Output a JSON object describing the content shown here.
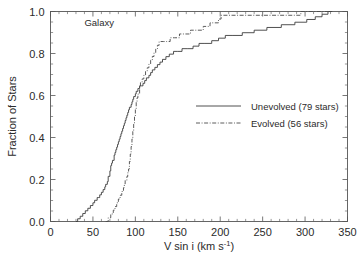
{
  "figure": {
    "panel_label": "Galaxy",
    "background": "#ffffff",
    "foreground": "#2b2b2b"
  },
  "chart_data": {
    "type": "line",
    "title": "",
    "subtitle": "",
    "xlabel": "V sin i (km s-1)",
    "xlabel_main": "V sin i (km s",
    "xlabel_sup": "-1",
    "xlabel_tail": ")",
    "ylabel": "Fraction of Stars",
    "xlim": [
      0,
      350
    ],
    "ylim": [
      0.0,
      1.0
    ],
    "xticks": [
      0,
      50,
      100,
      150,
      200,
      250,
      300,
      350
    ],
    "xticklabels": [
      "0",
      "50",
      "100",
      "150",
      "200",
      "250",
      "300",
      "350"
    ],
    "yticks": [
      0.0,
      0.2,
      0.4,
      0.6,
      0.8,
      1.0
    ],
    "yticklabels": [
      "0.0",
      "0.2",
      "0.4",
      "0.6",
      "0.8",
      "1.0"
    ],
    "x_minor_interval": 10,
    "y_minor_interval": 0.05,
    "grid": false,
    "ticks_all_sides": true,
    "tick_direction": "in",
    "annotations": [
      {
        "text": "Galaxy",
        "x": 40,
        "y": 0.93
      }
    ],
    "legend": {
      "position": "center-right",
      "frame": false,
      "entries": [
        {
          "label": "Unevolved (79 stars)",
          "linestyle": "solid",
          "color": "#3c3c3c"
        },
        {
          "label": "Evolved (56 stars)",
          "linestyle": "dashdot",
          "color": "#4a4a4a"
        }
      ]
    },
    "series": [
      {
        "name": "Unevolved (79 stars)",
        "n_stars": 79,
        "linestyle": "solid",
        "color": "#3c3c3c",
        "step": "post",
        "x": [
          30,
          32,
          35,
          38,
          41,
          44,
          47,
          50,
          52,
          55,
          57,
          58,
          60,
          62,
          64,
          65,
          67,
          68,
          70,
          71,
          72,
          73,
          75,
          76,
          77,
          78,
          79,
          80,
          81,
          82,
          83,
          84,
          85,
          86,
          87,
          88,
          89,
          90,
          91,
          92,
          93,
          95,
          96,
          97,
          98,
          100,
          101,
          103,
          105,
          107,
          109,
          111,
          113,
          116,
          118,
          120,
          123,
          126,
          129,
          132,
          136,
          140,
          145,
          150,
          155,
          161,
          168,
          175,
          182,
          190,
          198,
          206,
          215,
          226,
          240,
          255,
          272,
          288,
          302,
          312,
          320,
          327,
          332
        ],
        "y": [
          0.0,
          0.013,
          0.025,
          0.038,
          0.051,
          0.063,
          0.076,
          0.089,
          0.101,
          0.114,
          0.114,
          0.127,
          0.139,
          0.152,
          0.165,
          0.177,
          0.19,
          0.215,
          0.241,
          0.266,
          0.278,
          0.291,
          0.316,
          0.329,
          0.342,
          0.354,
          0.367,
          0.38,
          0.392,
          0.405,
          0.418,
          0.43,
          0.443,
          0.456,
          0.468,
          0.481,
          0.494,
          0.506,
          0.519,
          0.532,
          0.544,
          0.557,
          0.57,
          0.582,
          0.595,
          0.608,
          0.62,
          0.633,
          0.646,
          0.646,
          0.658,
          0.671,
          0.684,
          0.696,
          0.709,
          0.722,
          0.734,
          0.747,
          0.759,
          0.772,
          0.785,
          0.797,
          0.81,
          0.81,
          0.823,
          0.823,
          0.835,
          0.848,
          0.848,
          0.861,
          0.873,
          0.886,
          0.886,
          0.899,
          0.911,
          0.924,
          0.937,
          0.949,
          0.962,
          0.975,
          0.987,
          1.0,
          1.0
        ]
      },
      {
        "name": "Evolved (56 stars)",
        "n_stars": 56,
        "linestyle": "dashdot",
        "color": "#4a4a4a",
        "step": "post",
        "x": [
          65,
          68,
          71,
          74,
          76,
          78,
          80,
          82,
          84,
          86,
          87,
          88,
          90,
          91,
          92,
          93,
          94,
          95,
          96,
          97,
          98,
          99,
          100,
          101,
          102,
          103,
          105,
          106,
          108,
          110,
          112,
          114,
          116,
          118,
          120,
          122,
          124,
          126,
          128,
          130,
          133,
          137,
          141,
          146,
          152,
          158,
          165,
          172,
          180,
          188,
          198,
          201,
          215,
          232,
          250,
          268,
          285,
          295,
          332
        ],
        "y": [
          0.0,
          0.018,
          0.036,
          0.054,
          0.071,
          0.089,
          0.107,
          0.125,
          0.143,
          0.161,
          0.179,
          0.196,
          0.214,
          0.232,
          0.25,
          0.286,
          0.321,
          0.357,
          0.393,
          0.429,
          0.464,
          0.5,
          0.536,
          0.571,
          0.589,
          0.607,
          0.643,
          0.661,
          0.679,
          0.696,
          0.714,
          0.732,
          0.75,
          0.768,
          0.786,
          0.804,
          0.821,
          0.839,
          0.857,
          0.857,
          0.857,
          0.857,
          0.875,
          0.875,
          0.893,
          0.893,
          0.911,
          0.911,
          0.929,
          0.946,
          0.964,
          0.982,
          0.982,
          0.982,
          0.982,
          0.982,
          0.982,
          1.0,
          1.0
        ]
      }
    ]
  }
}
